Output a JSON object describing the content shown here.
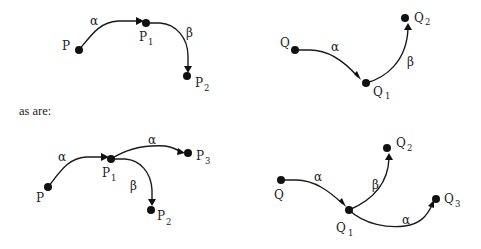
{
  "caption": "as are:",
  "diagrams": [
    {
      "id": "top-left",
      "labels": {
        "start": "P",
        "n1": "P",
        "n1_sub": "1",
        "n2": "P",
        "n2_sub": "2",
        "e1": "α",
        "e2": "β"
      }
    },
    {
      "id": "top-right",
      "labels": {
        "start": "Q",
        "n1": "Q",
        "n1_sub": "1",
        "n2": "Q",
        "n2_sub": "2",
        "e1": "α",
        "e2": "β"
      }
    },
    {
      "id": "bottom-left",
      "labels": {
        "start": "P",
        "n1": "P",
        "n1_sub": "1",
        "n2": "P",
        "n2_sub": "2",
        "n3": "P",
        "n3_sub": "3",
        "e1": "α",
        "e2": "β",
        "e3": "α"
      }
    },
    {
      "id": "bottom-right",
      "labels": {
        "start": "Q",
        "n1": "Q",
        "n1_sub": "1",
        "n2": "Q",
        "n2_sub": "2",
        "n3": "Q",
        "n3_sub": "3",
        "e1": "α",
        "e2": "β",
        "e3": "α"
      }
    }
  ]
}
